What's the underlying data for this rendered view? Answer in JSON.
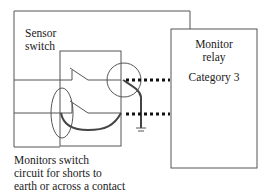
{
  "diagram": {
    "sensor_label_line1": "Sensor",
    "sensor_label_line2": "switch",
    "relay_label_line1": "Monitor",
    "relay_label_line2": "relay",
    "relay_category": "Category 3",
    "caption_line1": "Monitors switch",
    "caption_line2": "circuit for shorts to",
    "caption_line3": "earth or across a contact",
    "colors": {
      "line": "#555555",
      "wire": "#444444",
      "dots": "#111111",
      "text": "#1a1a1a"
    }
  }
}
